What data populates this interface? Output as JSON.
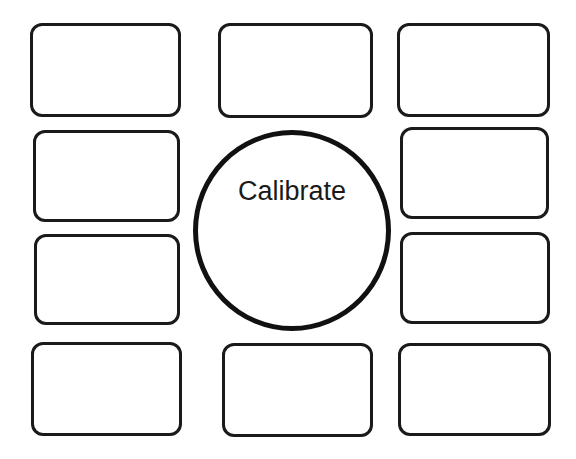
{
  "calibrate_button": {
    "label": "Calibrate"
  },
  "slots": [
    {
      "id": "r1c1",
      "x": 30,
      "y": 23,
      "w": 151,
      "h": 94
    },
    {
      "id": "r1c2",
      "x": 218,
      "y": 23,
      "w": 155,
      "h": 95
    },
    {
      "id": "r1c3",
      "x": 397,
      "y": 23,
      "w": 153,
      "h": 94
    },
    {
      "id": "r2c1",
      "x": 33,
      "y": 130,
      "w": 147,
      "h": 92
    },
    {
      "id": "r2c3",
      "x": 400,
      "y": 127,
      "w": 149,
      "h": 92
    },
    {
      "id": "r3c1",
      "x": 34,
      "y": 234,
      "w": 146,
      "h": 91
    },
    {
      "id": "r3c3",
      "x": 400,
      "y": 232,
      "w": 150,
      "h": 92
    },
    {
      "id": "r4c1",
      "x": 31,
      "y": 342,
      "w": 151,
      "h": 94
    },
    {
      "id": "r4c2",
      "x": 222,
      "y": 343,
      "w": 151,
      "h": 94
    },
    {
      "id": "r4c3",
      "x": 398,
      "y": 343,
      "w": 153,
      "h": 93
    }
  ],
  "colors": {
    "stroke": "#1a1a1a",
    "background": "#ffffff"
  }
}
